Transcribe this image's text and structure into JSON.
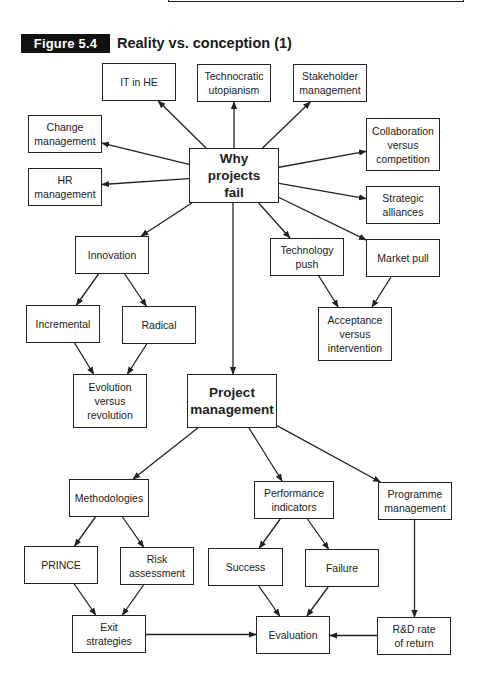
{
  "figure": {
    "label": "Figure 5.4",
    "title": "Reality vs. conception (1)"
  },
  "nodes": {
    "why_projects_fail": "Why\nprojects\nfail",
    "it_in_he": "IT in HE",
    "technocratic_utopianism": "Technocratic\nutopianism",
    "stakeholder_management": "Stakeholder\nmanagement",
    "change_management": "Change\nmanagement",
    "hr_management": "HR\nmanagement",
    "collaboration_versus_competition": "Collaboration\nversus\ncompetition",
    "strategic_alliances": "Strategic\nalliances",
    "innovation": "Innovation",
    "incremental": "Incremental",
    "radical": "Radical",
    "evolution_versus_revolution": "Evolution\nversus\nrevolution",
    "technology_push": "Technology\npush",
    "market_pull": "Market pull",
    "acceptance_versus_intervention": "Acceptance\nversus\nintervention",
    "project_management": "Project\nmanagement",
    "methodologies": "Methodologies",
    "performance_indicators": "Performance\nindicators",
    "programme_management": "Programme\nmanagement",
    "prince": "PRINCE",
    "risk_assessment": "Risk\nassessment",
    "success": "Success",
    "failure": "Failure",
    "exit_strategies": "Exit\nstrategies",
    "evaluation": "Evaluation",
    "rd_rate_of_return": "R&D rate\nof return"
  },
  "edges": [
    {
      "from": "why_projects_fail",
      "to": "it_in_he"
    },
    {
      "from": "why_projects_fail",
      "to": "technocratic_utopianism"
    },
    {
      "from": "why_projects_fail",
      "to": "stakeholder_management"
    },
    {
      "from": "why_projects_fail",
      "to": "change_management"
    },
    {
      "from": "why_projects_fail",
      "to": "hr_management"
    },
    {
      "from": "why_projects_fail",
      "to": "collaboration_versus_competition"
    },
    {
      "from": "why_projects_fail",
      "to": "strategic_alliances"
    },
    {
      "from": "why_projects_fail",
      "to": "innovation"
    },
    {
      "from": "why_projects_fail",
      "to": "technology_push"
    },
    {
      "from": "why_projects_fail",
      "to": "market_pull"
    },
    {
      "from": "why_projects_fail",
      "to": "project_management"
    },
    {
      "from": "innovation",
      "to": "incremental"
    },
    {
      "from": "innovation",
      "to": "radical"
    },
    {
      "from": "incremental",
      "to": "evolution_versus_revolution"
    },
    {
      "from": "radical",
      "to": "evolution_versus_revolution"
    },
    {
      "from": "technology_push",
      "to": "acceptance_versus_intervention"
    },
    {
      "from": "market_pull",
      "to": "acceptance_versus_intervention"
    },
    {
      "from": "project_management",
      "to": "methodologies"
    },
    {
      "from": "project_management",
      "to": "performance_indicators"
    },
    {
      "from": "project_management",
      "to": "programme_management"
    },
    {
      "from": "methodologies",
      "to": "prince"
    },
    {
      "from": "methodologies",
      "to": "risk_assessment"
    },
    {
      "from": "performance_indicators",
      "to": "success"
    },
    {
      "from": "performance_indicators",
      "to": "failure"
    },
    {
      "from": "programme_management",
      "to": "rd_rate_of_return"
    },
    {
      "from": "prince",
      "to": "exit_strategies"
    },
    {
      "from": "risk_assessment",
      "to": "exit_strategies"
    },
    {
      "from": "success",
      "to": "evaluation"
    },
    {
      "from": "failure",
      "to": "evaluation"
    },
    {
      "from": "exit_strategies",
      "to": "evaluation"
    },
    {
      "from": "rd_rate_of_return",
      "to": "evaluation"
    }
  ]
}
